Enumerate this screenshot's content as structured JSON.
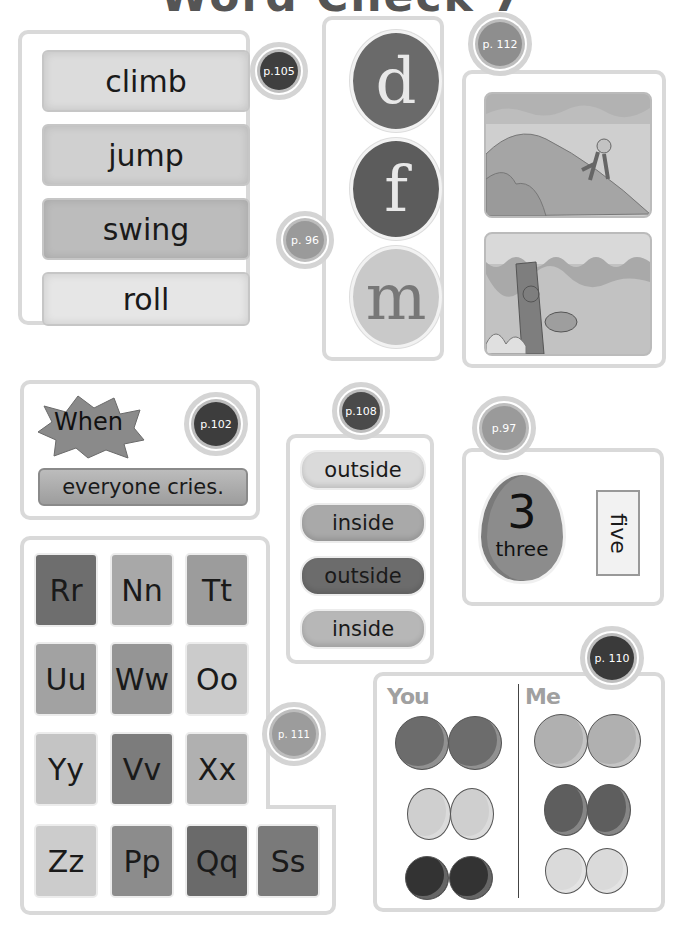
{
  "page_title_fragment": "Word Check 7",
  "colors": {
    "panel_border": "#d9d9d9",
    "badge_dark": "#3f3f3f",
    "badge_mid": "#8a8a8a"
  },
  "panels": {
    "action_words": {
      "badge": "p.105",
      "words": [
        "climb",
        "jump",
        "swing",
        "roll"
      ]
    },
    "letter_characters": {
      "badge": "p. 96",
      "letters": [
        "d",
        "f",
        "m"
      ]
    },
    "story_scenes": {
      "badge": "p. 112",
      "scenes": [
        "monkey-climbing-hill-scene",
        "monkey-swinging-tree-scene"
      ]
    },
    "sentence": {
      "badge": "p.102",
      "burst_word": "When",
      "phrase": "everyone cries."
    },
    "inside_outside": {
      "badge": "p.108",
      "pills": [
        "outside",
        "inside",
        "outside",
        "inside"
      ]
    },
    "number_egg": {
      "badge": "p.97",
      "number": "3",
      "number_word": "three",
      "card_word": "five"
    },
    "alphabet": {
      "badge": "p. 111",
      "rows": [
        [
          "Rr",
          "Nn",
          "Tt"
        ],
        [
          "Uu",
          "Ww",
          "Oo"
        ],
        [
          "Yy",
          "Vv",
          "Xx"
        ],
        [
          "Zz",
          "Pp",
          "Qq",
          "Ss"
        ]
      ]
    },
    "you_me": {
      "badge": "p. 110",
      "you_label": "You",
      "me_label": "Me"
    }
  }
}
